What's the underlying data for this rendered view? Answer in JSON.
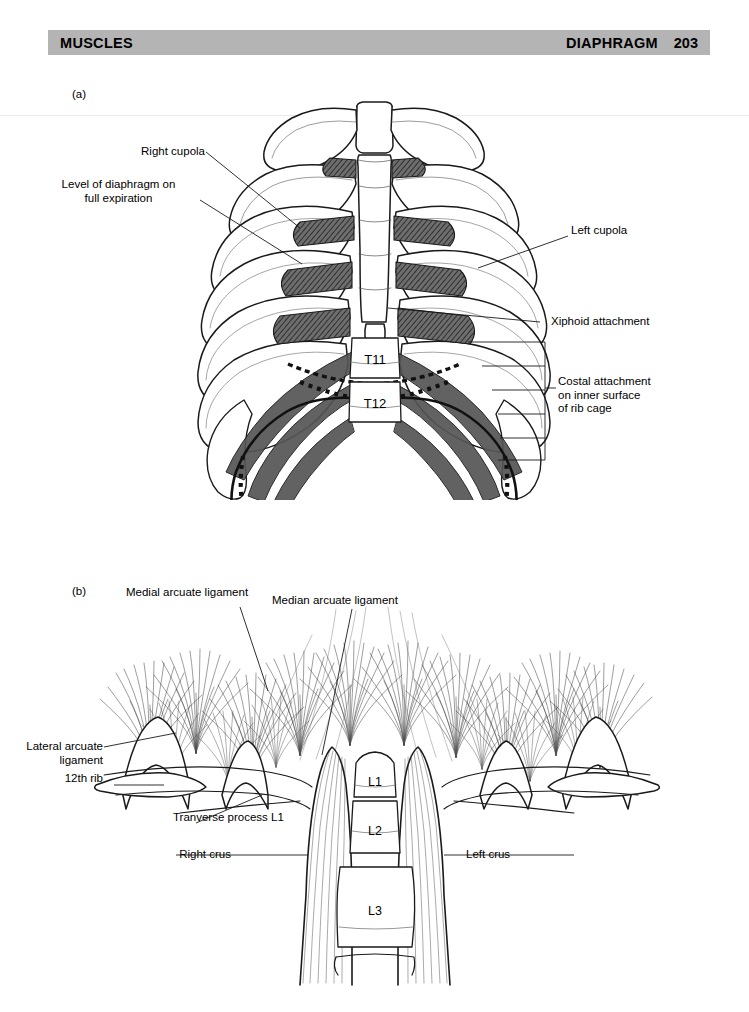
{
  "header": {
    "left_title": "MUSCLES",
    "right_title": "DIAPHRAGM",
    "page_number": "203"
  },
  "figures": [
    {
      "id": "figure-a",
      "letter": "(a)",
      "caption_subject": "diaphragm attachments on rib cage, anterior view",
      "labels": [
        {
          "name": "right-cupola",
          "text": "Right cupola"
        },
        {
          "name": "level-of-diaphragm",
          "text": "Level of diaphragm on\nfull expiration"
        },
        {
          "name": "left-cupola",
          "text": "Left cupola"
        },
        {
          "name": "xiphoid-attachment",
          "text": "Xiphoid attachment"
        },
        {
          "name": "costal-attachment",
          "text": "Costal attachment\non inner surface\nof rib cage"
        }
      ],
      "vertebrae": [
        {
          "name": "vertebra-t11",
          "text": "T11"
        },
        {
          "name": "vertebra-t12",
          "text": "T12"
        }
      ]
    },
    {
      "id": "figure-b",
      "letter": "(b)",
      "caption_subject": "diaphragm crura and arcuate ligaments, posterior view",
      "labels": [
        {
          "name": "medial-arcuate-ligament",
          "text": "Medial arcuate ligament"
        },
        {
          "name": "median-arcuate-ligament",
          "text": "Median arcuate ligament"
        },
        {
          "name": "lateral-arcuate-ligament",
          "text": "Lateral arcuate\nligament"
        },
        {
          "name": "twelfth-rib",
          "text": "12th rib"
        },
        {
          "name": "transverse-process-l1",
          "text": "Tranverse process L1"
        },
        {
          "name": "right-crus",
          "text": "Right crus"
        },
        {
          "name": "left-crus",
          "text": "Left crus"
        }
      ],
      "vertebrae": [
        {
          "name": "vertebra-l1",
          "text": "L1"
        },
        {
          "name": "vertebra-l2",
          "text": "L2"
        },
        {
          "name": "vertebra-l3",
          "text": "L3"
        }
      ]
    }
  ],
  "colors": {
    "header_bar": "#b4b4b4",
    "ink": "#1a1a1a",
    "cartilage_shade": "#4a4a4a",
    "page_background": "#ffffff"
  }
}
